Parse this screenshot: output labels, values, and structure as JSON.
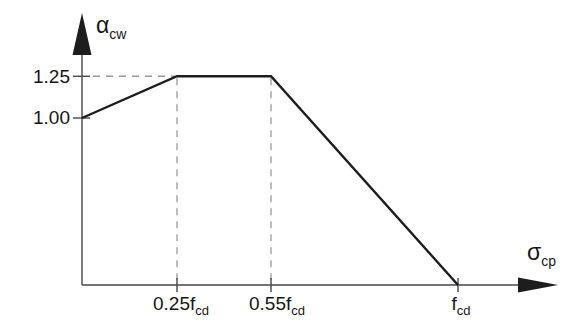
{
  "chart_data": {
    "type": "line",
    "title": "",
    "ylabel": {
      "base": "α",
      "sub": "cw"
    },
    "xlabel": {
      "base": "σ",
      "sub": "cp"
    },
    "x_axis_unit": "fcd",
    "series": [
      {
        "name": "alpha_cw",
        "points": [
          {
            "x": 0,
            "y": 1.0
          },
          {
            "x": 0.25,
            "y": 1.25
          },
          {
            "x": 0.55,
            "y": 1.25
          },
          {
            "x": 1.0,
            "y": 0
          }
        ]
      }
    ],
    "x_ticks": [
      {
        "value": 0.25,
        "label": "0.25",
        "unit": "f",
        "unit_sub": "cd"
      },
      {
        "value": 0.55,
        "label": "0.55",
        "unit": "f",
        "unit_sub": "cd"
      },
      {
        "value": 1.0,
        "label": "",
        "unit": "f",
        "unit_sub": "cd"
      }
    ],
    "y_ticks": [
      {
        "value": 1.25,
        "label": "1.25"
      },
      {
        "value": 1.0,
        "label": "1.00"
      }
    ],
    "xlim": [
      0,
      1.26
    ],
    "ylim": [
      0,
      1.5
    ],
    "grid": false,
    "legend_position": "none",
    "dashed_guides": {
      "horizontal": [
        {
          "y": 1.25,
          "x_from": 0,
          "x_to": 0.25
        }
      ],
      "vertical": [
        {
          "x": 0.25,
          "y_from": 0,
          "y_to": 1.25
        },
        {
          "x": 0.55,
          "y_from": 0,
          "y_to": 1.25
        }
      ]
    },
    "colors": {
      "line": "#1d1d1d",
      "axis": "#474747",
      "dash": "#9a9a9a",
      "text": "#161616",
      "background": "#ffffff"
    }
  }
}
